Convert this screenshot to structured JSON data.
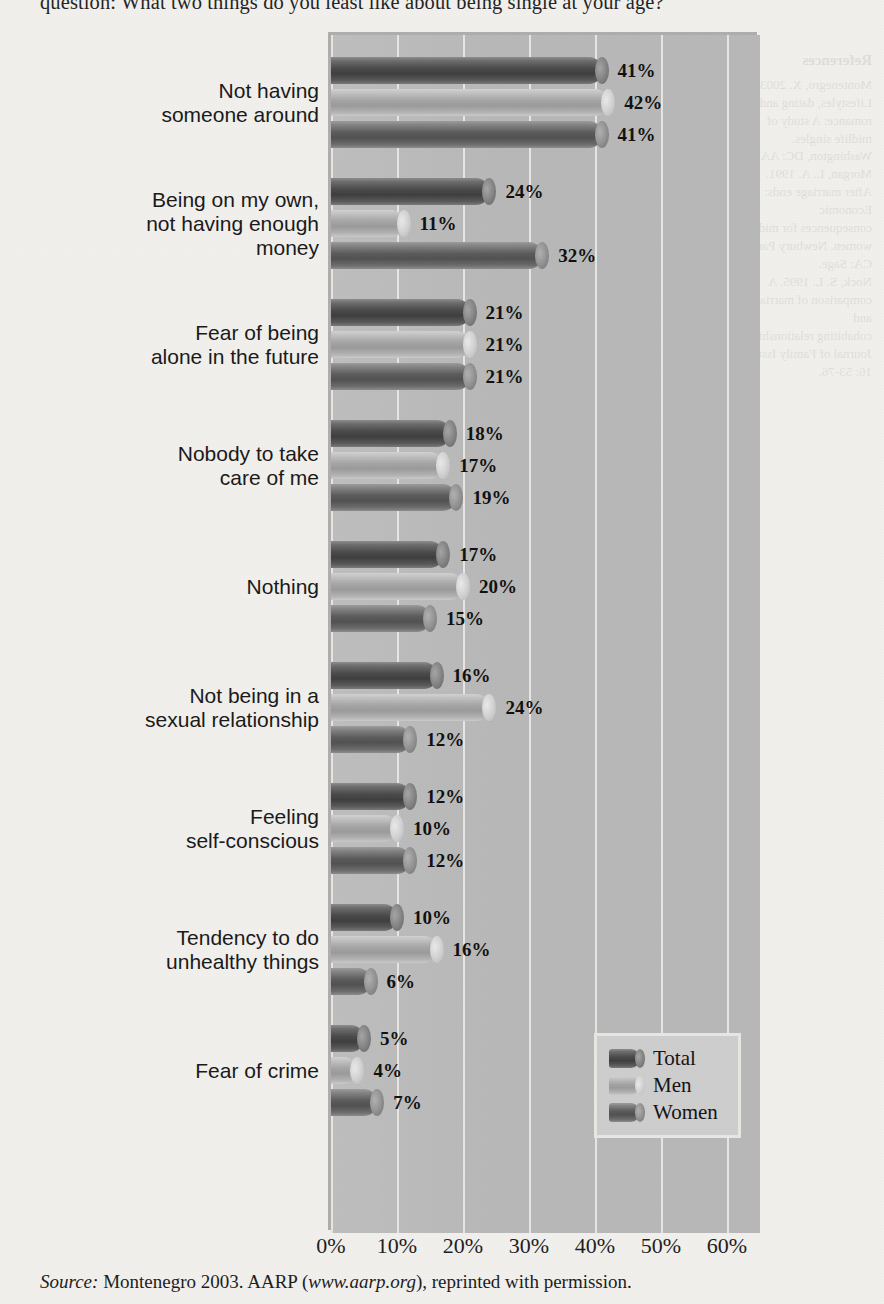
{
  "question": "question: What two things do you least like about being single at your age?",
  "source": {
    "label": "Source:",
    "text_before": " Montenegro 2003. AARP (",
    "url": "www.aarp.org",
    "text_after": "), reprinted with permission."
  },
  "bleed": {
    "title": "References",
    "lines": [
      "Montenegro, X. 2003. Lifestyles, dating and",
      "romance: A study of midlife singles.",
      "Washington, DC: AARP.",
      "Morgan, L. A. 1991. After marriage ends: Economic",
      "consequences for midlife women. Newbury Park,",
      "CA: Sage.",
      "Nock, S. L. 1995. A comparison of marriages and",
      "cohabiting relationships. Journal of Family Issues",
      "16: 53-76."
    ]
  },
  "chart_data": {
    "type": "bar",
    "orientation": "horizontal",
    "title": "",
    "xlabel": "",
    "ylabel": "",
    "xlim": [
      0,
      65
    ],
    "xticks": [
      0,
      10,
      20,
      30,
      40,
      50,
      60
    ],
    "xtick_labels": [
      "0%",
      "10%",
      "20%",
      "30%",
      "40%",
      "50%",
      "60%"
    ],
    "grid": true,
    "legend_position": "bottom-right",
    "value_suffix": "%",
    "categories": [
      "Not having\nsomeone around",
      "Being on my own,\nnot having enough\nmoney",
      "Fear of being\nalone in the future",
      "Nobody to take\ncare of me",
      "Nothing",
      "Not being in a\nsexual relationship",
      "Feeling\nself-conscious",
      "Tendency to do\nunhealthy things",
      "Fear of crime"
    ],
    "series": [
      {
        "name": "Total",
        "color": "#4b4b4b",
        "values": [
          41,
          24,
          21,
          18,
          17,
          16,
          12,
          10,
          5
        ]
      },
      {
        "name": "Men",
        "color": "#a6a6a6",
        "values": [
          42,
          11,
          21,
          17,
          20,
          24,
          10,
          16,
          4
        ]
      },
      {
        "name": "Women",
        "color": "#5d5d5d",
        "values": [
          41,
          32,
          21,
          19,
          15,
          12,
          12,
          6,
          7
        ]
      }
    ]
  }
}
